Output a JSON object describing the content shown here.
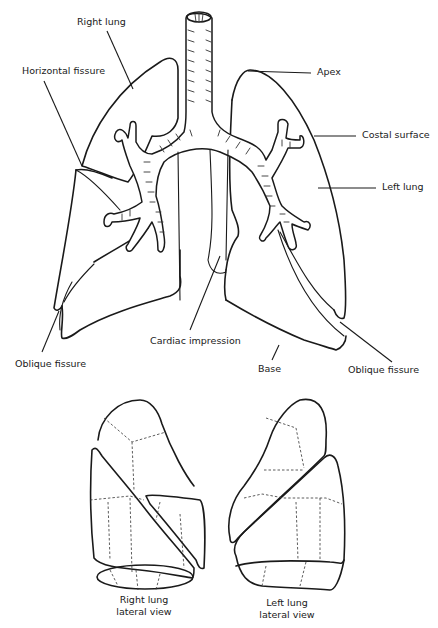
{
  "figure": {
    "type": "anatomical line drawing",
    "colors": {
      "ink": "#1a1a1a",
      "background": "#ffffff"
    }
  },
  "labels": {
    "right_lung": "Right lung",
    "horizontal_fissure": "Horizontal fissure",
    "apex": "Apex",
    "costal_surface": "Costal surface",
    "left_lung": "Left lung",
    "oblique_fissure_right": "Oblique fissure",
    "cardiac_impression": "Cardiac impression",
    "base": "Base",
    "oblique_fissure_left": "Oblique fissure"
  },
  "captions": {
    "right_lateral_line1": "Right lung",
    "right_lateral_line2": "lateral view",
    "left_lateral_line1": "Left lung",
    "left_lateral_line2": "lateral view"
  }
}
